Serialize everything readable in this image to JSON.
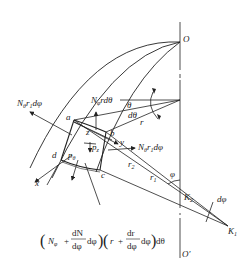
{
  "diagram": {
    "type": "shell element free-body diagram",
    "points": {
      "O": "O",
      "O_prime": "O′",
      "a": "a",
      "b": "b",
      "c": "c",
      "d": "d",
      "K1": "K",
      "K1_sub": "1",
      "K2": "K",
      "K2_sub": "2"
    },
    "axes": {
      "x": "x",
      "y": "y",
      "z": "z"
    },
    "forces": {
      "N_theta_r1_dphi_left": "N",
      "N_theta_sub": "θ",
      "N_theta_r1_dphi_left_rest": "r",
      "r1_sub": "1",
      "dphi": "dφ",
      "N_phi_r_dtheta": "N",
      "N_phi_sub": "φ",
      "N_phi_rest": "rdθ",
      "N_theta_r1_dphi_right": "N",
      "p_theta": "p",
      "p_theta_sub": "θ",
      "p_z": "p",
      "p_z_sub": "z"
    },
    "angles": {
      "theta": "θ",
      "dtheta": "dθ",
      "phi": "φ",
      "dphi": "dφ"
    },
    "lengths": {
      "r": "r",
      "r1": "r",
      "r1_sub": "1",
      "r2": "r",
      "r2_sub": "2"
    },
    "formula": {
      "open1": "(",
      "N": "N",
      "N_sub": "φ",
      "plus1": "+",
      "dN_num": "dN",
      "dN_den": "dφ",
      "dphi1": "dφ",
      "close1": ")",
      "open2": "(",
      "r": "r",
      "plus2": "+",
      "dr_num": "dr",
      "dr_den": "dφ",
      "dphi2": "dφ",
      "close2": ")",
      "dtheta": "dθ"
    },
    "colors": {
      "line": "#222222",
      "background": "#ffffff"
    }
  }
}
